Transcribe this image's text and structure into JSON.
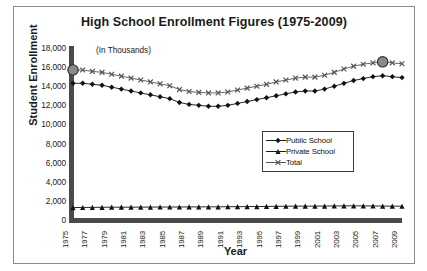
{
  "top_bleed_text": "",
  "chart": {
    "title": "High School Enrollment Figures (1975-2009)",
    "units_note": "(In Thousands)",
    "xlabel": "Year",
    "ylabel": "Student Enrollment",
    "legend": {
      "items": [
        {
          "label": "Public School",
          "marker": "diamond-marker",
          "color": "#1a1a1a"
        },
        {
          "label": "Private School",
          "marker": "triangle-marker",
          "color": "#1a1a1a"
        },
        {
          "label": "Total",
          "marker": "cross-marker",
          "color": "#555555"
        }
      ]
    }
  },
  "chart_data": {
    "type": "line",
    "title": "High School Enrollment Figures (1975-2009)",
    "subtitle": "(In Thousands)",
    "xlabel": "Year",
    "ylabel": "Student Enrollment",
    "grid": false,
    "legend_position": "inside-right-middle",
    "ylim": [
      0,
      18000
    ],
    "ytick_labels": [
      "18,000",
      "16,000",
      "14,000",
      "12,000",
      "10,000",
      "8,000",
      "6,000",
      "4,000",
      "2,000",
      "0"
    ],
    "yticks": [
      18000,
      16000,
      14000,
      12000,
      10000,
      8000,
      6000,
      4000,
      2000,
      0
    ],
    "xtick_labels": [
      "1975",
      "1977",
      "1979",
      "1981",
      "1983",
      "1985",
      "1987",
      "1989",
      "1991",
      "1993",
      "1995",
      "1997",
      "1999",
      "2001",
      "2003",
      "2005",
      "2007",
      "2009"
    ],
    "x": [
      1975,
      1976,
      1977,
      1978,
      1979,
      1980,
      1981,
      1982,
      1983,
      1984,
      1985,
      1986,
      1987,
      1988,
      1989,
      1990,
      1991,
      1992,
      1993,
      1994,
      1995,
      1996,
      1997,
      1998,
      1999,
      2000,
      2001,
      2002,
      2003,
      2004,
      2005,
      2006,
      2007,
      2008,
      2009
    ],
    "series": [
      {
        "name": "Public School",
        "marker": "diamond",
        "color": "#111111",
        "values": [
          14300,
          14310,
          14200,
          14100,
          13900,
          13700,
          13500,
          13300,
          13100,
          12900,
          12700,
          12300,
          12100,
          12000,
          11900,
          11900,
          12000,
          12200,
          12400,
          12600,
          12800,
          13000,
          13200,
          13400,
          13500,
          13500,
          13700,
          14000,
          14300,
          14600,
          14800,
          15000,
          15100,
          15000,
          14900
        ],
        "highlighted_points": []
      },
      {
        "name": "Private School",
        "marker": "triangle",
        "color": "#111111",
        "values": [
          1300,
          1310,
          1320,
          1330,
          1340,
          1340,
          1340,
          1350,
          1350,
          1360,
          1360,
          1360,
          1370,
          1370,
          1380,
          1380,
          1390,
          1400,
          1400,
          1410,
          1420,
          1430,
          1440,
          1450,
          1450,
          1450,
          1460,
          1470,
          1480,
          1480,
          1480,
          1470,
          1460,
          1450,
          1440
        ],
        "highlighted_points": []
      },
      {
        "name": "Total",
        "marker": "cross",
        "color": "#555555",
        "values": [
          15700,
          15700,
          15550,
          15450,
          15250,
          15050,
          14850,
          14650,
          14450,
          14250,
          14050,
          13650,
          13450,
          13350,
          13300,
          13300,
          13400,
          13600,
          13800,
          14000,
          14200,
          14450,
          14650,
          14850,
          14950,
          14950,
          15150,
          15450,
          15800,
          16100,
          16300,
          16450,
          16550,
          16450,
          16350
        ],
        "highlighted_points": [
          {
            "x": 1975,
            "y": 15700,
            "style": "gray-filled-circle"
          },
          {
            "x": 2007,
            "y": 16550,
            "style": "gray-filled-circle"
          }
        ]
      }
    ]
  }
}
